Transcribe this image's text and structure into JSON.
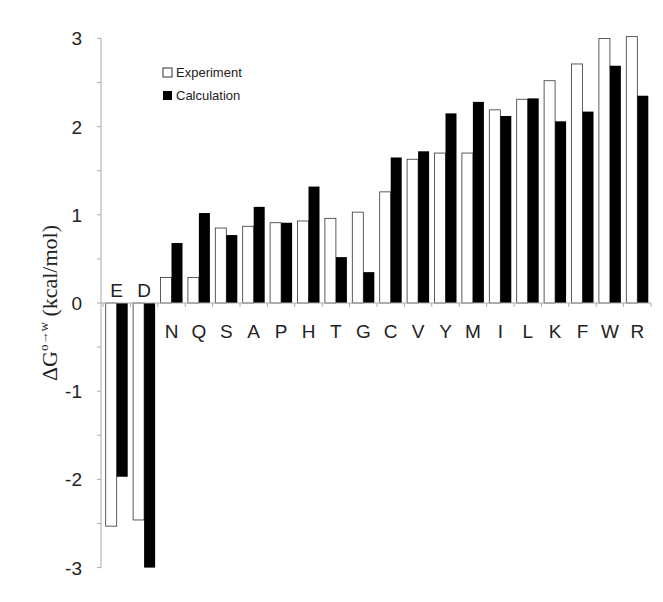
{
  "chart_data": {
    "type": "bar",
    "title": "",
    "xlabel": "",
    "ylabel": "ΔG°→w (kcal/mol)",
    "ylim": [
      -3,
      3
    ],
    "yticks": [
      -3,
      -2,
      -1,
      0,
      1,
      2,
      3
    ],
    "grid": false,
    "legend_position": "upper-left-inside",
    "categories": [
      "E",
      "D",
      "N",
      "Q",
      "S",
      "A",
      "P",
      "H",
      "T",
      "G",
      "C",
      "V",
      "Y",
      "M",
      "I",
      "L",
      "K",
      "F",
      "W",
      "R"
    ],
    "series": [
      {
        "name": "Experiment",
        "fill": "#ffffff",
        "stroke": "#333333",
        "values": [
          -2.53,
          -2.46,
          0.29,
          0.29,
          0.85,
          0.87,
          0.91,
          0.93,
          0.96,
          1.03,
          1.26,
          1.63,
          1.7,
          1.7,
          2.19,
          2.31,
          2.52,
          2.71,
          3.0,
          3.02
        ]
      },
      {
        "name": "Calculation",
        "fill": "#000000",
        "stroke": "#000000",
        "values": [
          -1.97,
          -3.0,
          0.68,
          1.02,
          0.77,
          1.09,
          0.91,
          1.32,
          0.52,
          0.35,
          1.65,
          1.72,
          2.15,
          2.28,
          2.12,
          2.32,
          2.06,
          2.17,
          2.69,
          2.35
        ]
      }
    ]
  },
  "legend": {
    "items": [
      {
        "label": "Experiment"
      },
      {
        "label": "Calculation"
      }
    ]
  },
  "axis": {
    "ylabel_main": "ΔG",
    "ylabel_sup": "o→w",
    "ylabel_unit": " (kcal/mol)"
  }
}
